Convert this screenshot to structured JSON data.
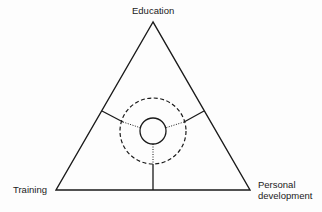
{
  "labels": {
    "top": "Education",
    "left": "Training",
    "right_line1": "Personal",
    "right_line2": "development"
  },
  "colors": {
    "stroke": "#1a1a1a",
    "background": "#fdfdfd"
  }
}
